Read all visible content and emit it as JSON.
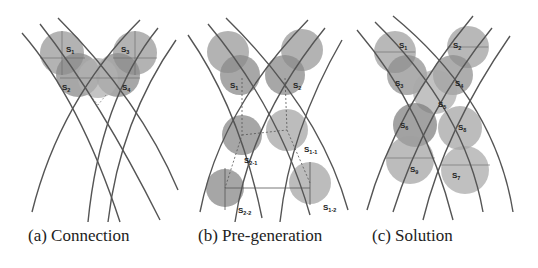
{
  "figure": {
    "panels": [
      {
        "id": "a",
        "caption": "(a) Connection",
        "circle_labels": [
          "S1",
          "S2",
          "S3",
          "S4"
        ]
      },
      {
        "id": "b",
        "caption": "(b) Pre-generation",
        "circle_labels": [
          "S1",
          "S2",
          "S2-1",
          "S1-1",
          "S2-2",
          "S1-2"
        ]
      },
      {
        "id": "c",
        "caption": "(c) Solution",
        "circle_labels": [
          "S1",
          "S2",
          "S3",
          "S4",
          "S5",
          "S6",
          "S8",
          "S9",
          "S7"
        ]
      }
    ],
    "colors": {
      "curve": "#555555",
      "circle_light": "#a8a8a8",
      "circle_dark": "#7a7a7a",
      "text": "#222222"
    }
  }
}
